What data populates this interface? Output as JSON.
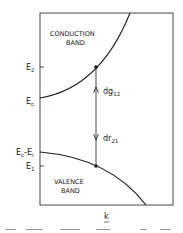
{
  "diagram": {
    "regions": {
      "conduction_line1": "CONDUCTION",
      "conduction_line2": "BAND",
      "valence_line1": "VALENCE",
      "valence_line2": "BAND"
    },
    "energy_levels": {
      "e2": {
        "main": "E",
        "sub": "2"
      },
      "ec": {
        "main": "E",
        "sub": "c"
      },
      "ec_ei": {
        "main1": "E",
        "sub1": "c",
        "mid": "-E",
        "sub2": "i"
      },
      "e1": {
        "main": "E",
        "sub": "1"
      }
    },
    "transitions": {
      "up": {
        "main": "dg",
        "sub": "12"
      },
      "down": {
        "main": "dr",
        "sub": "21"
      }
    },
    "x_axis_label": "k",
    "colors": {
      "line": "#1a1a1a",
      "background": "#ffffff"
    }
  }
}
